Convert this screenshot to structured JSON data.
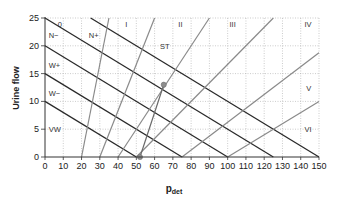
{
  "chart_data": {
    "type": "line",
    "title": "",
    "xlabel": "p",
    "xlabel_sub": "det",
    "ylabel": "Urine flow",
    "xlim": [
      0,
      150
    ],
    "ylim": [
      0,
      25
    ],
    "x_ticks": [
      0,
      10,
      20,
      30,
      40,
      50,
      60,
      70,
      80,
      90,
      100,
      110,
      120,
      130,
      140,
      150
    ],
    "y_ticks": [
      0,
      5,
      10,
      15,
      20,
      25
    ],
    "grid": true,
    "legend": "none",
    "contractility_lines": [
      {
        "name": "VW/W- boundary",
        "points": [
          [
            0,
            10
          ],
          [
            50,
            0
          ]
        ]
      },
      {
        "name": "W-/W+ boundary",
        "points": [
          [
            0,
            15
          ],
          [
            75,
            0
          ]
        ]
      },
      {
        "name": "W+/N- boundary",
        "points": [
          [
            0,
            20
          ],
          [
            100,
            0
          ]
        ]
      },
      {
        "name": "N-/N+ boundary",
        "points": [
          [
            0,
            25
          ],
          [
            125,
            0
          ]
        ]
      },
      {
        "name": "N+/S boundary",
        "points": [
          [
            25,
            25
          ],
          [
            150,
            0
          ]
        ]
      }
    ],
    "obstruction_lines": [
      {
        "name": "0/I boundary",
        "points": [
          [
            20,
            0
          ],
          [
            35,
            25
          ]
        ]
      },
      {
        "name": "I/II boundary",
        "points": [
          [
            30,
            0
          ],
          [
            60,
            25
          ]
        ]
      },
      {
        "name": "II/III boundary",
        "points": [
          [
            40,
            0
          ],
          [
            90,
            25
          ]
        ]
      },
      {
        "name": "III/IV boundary",
        "points": [
          [
            50,
            0
          ],
          [
            125,
            25
          ]
        ]
      },
      {
        "name": "IV/V boundary",
        "points": [
          [
            75,
            0
          ],
          [
            150,
            18.75
          ]
        ]
      },
      {
        "name": "V/VI boundary",
        "points": [
          [
            100,
            0
          ],
          [
            150,
            10
          ]
        ]
      }
    ],
    "patient_plot": {
      "points": [
        [
          52,
          0
        ],
        [
          65,
          13
        ]
      ],
      "description": "Line connecting two circle markers"
    },
    "region_labels": [
      {
        "text": "0",
        "x": 7,
        "y": 24
      },
      {
        "text": "N−",
        "x": 2,
        "y": 22
      },
      {
        "text": "N+",
        "x": 24,
        "y": 22
      },
      {
        "text": "I",
        "x": 44,
        "y": 24
      },
      {
        "text": "II",
        "x": 73,
        "y": 24
      },
      {
        "text": "ST",
        "x": 63,
        "y": 20
      },
      {
        "text": "III",
        "x": 101,
        "y": 24
      },
      {
        "text": "IV",
        "x": 142,
        "y": 24
      },
      {
        "text": "W+",
        "x": 2,
        "y": 16.5
      },
      {
        "text": "W−",
        "x": 2,
        "y": 11.5
      },
      {
        "text": "V",
        "x": 143,
        "y": 12.5
      },
      {
        "text": "VW",
        "x": 2,
        "y": 5
      },
      {
        "text": "VI",
        "x": 142,
        "y": 5
      }
    ]
  },
  "colors": {
    "contractility_line": "#2a2a2a",
    "obstruction_line": "#8a8a8a",
    "patient_line": "#6a6a6a",
    "marker": "#8e8e8e",
    "grid": "#aaaaaa",
    "axis": "#333333"
  }
}
